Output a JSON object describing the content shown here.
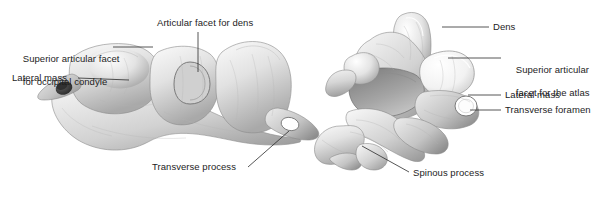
{
  "figure": {
    "background_color": "#ffffff",
    "label_color": "#1d1d1d",
    "leader_color": "#2b2b2b",
    "bone_light": "#f2f2f2",
    "bone_mid": "#c9c9c9",
    "bone_dark": "#8f8f8f",
    "bone_shadow": "#5a5a5a"
  },
  "panels": {
    "left": {
      "name": "atlas-c1-superior-oblique-view",
      "labels": {
        "superior_articular_facet": "Superior articular facet\nfor occipital condyle",
        "superior_articular_facet_line1": "Superior articular facet",
        "superior_articular_facet_line2": "for occipital condyle",
        "lateral_mass": "Lateral mass",
        "articular_facet_for_dens": "Articular facet for dens",
        "transverse_process": "Transverse process"
      }
    },
    "right": {
      "name": "axis-c2-superior-posterior-view",
      "labels": {
        "dens": "Dens",
        "superior_articular_facet_for_atlas": "Superior articular\nfacet for the atlas",
        "superior_articular_facet_for_atlas_line1": "Superior articular",
        "superior_articular_facet_for_atlas_line2": "facet for the atlas",
        "lateral_mass": "Lateral mass",
        "transverse_foramen": "Transverse foramen",
        "spinous_process": "Spinous process"
      }
    }
  }
}
